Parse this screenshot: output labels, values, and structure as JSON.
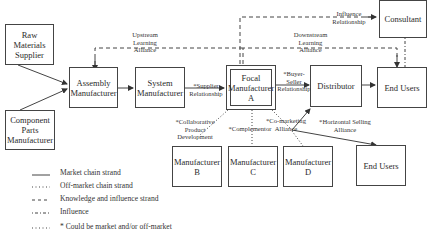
{
  "diagram": {
    "nodes": {
      "raw_materials": "Raw\nMaterials\nSupplier",
      "component_parts": "Component\nParts\nManufacturer",
      "assembly": "Assembly\nManufacturer",
      "system": "System\nManufacturer",
      "focal": "Focal\nManufacturer\nA",
      "distributor": "Distributor",
      "end_users_top": "End Users",
      "consultant": "Consultant",
      "manufacturer_b": "Manufacturer\nB",
      "manufacturer_c": "Manufacturer\nC",
      "manufacturer_d": "Manufacturer\nD",
      "end_users_bottom": "End Users"
    },
    "edge_labels": {
      "upstream": "Upstream\nLearning\nAlliance",
      "downstream": "Downstream\nLearning\nAlliance",
      "influence": "Influence\nRelationship",
      "supplier": "*Supplier\nRelationship",
      "buyer_seller": "*Buyer-\nSeller\nRelationship",
      "collaborative": "*Collaborative\nProduct\nDevelopment",
      "complementor": "*Complementor",
      "co_marketing": "*Co-marketing\nAlliance",
      "horizontal_selling": "*Horizontal Selling\nAlliance"
    },
    "legend": [
      {
        "style": "solid",
        "label": "Market chain strand"
      },
      {
        "style": "dotted",
        "label": "Off-market chain strand"
      },
      {
        "style": "dashed",
        "label": "Knowledge and influence strand"
      },
      {
        "style": "dashdot",
        "label": "Influence"
      },
      {
        "style": "dotted",
        "label": "* Could be market and/or off-market"
      }
    ],
    "colors": {
      "stroke": "#444444",
      "text": "#2a2a2a",
      "background": "#ffffff"
    }
  }
}
